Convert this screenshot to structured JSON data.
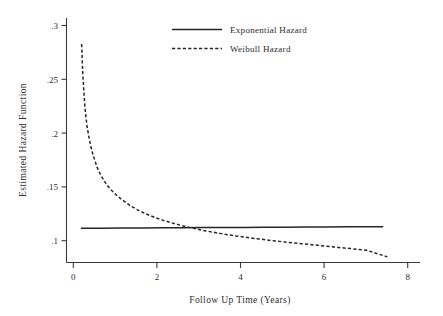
{
  "chart_data": {
    "type": "line",
    "title": "",
    "xlabel": "Follow Up Time (Years)",
    "ylabel": "Estimated Hazard Function",
    "xlim": [
      -0.35,
      8.3
    ],
    "ylim": [
      0.082,
      0.307
    ],
    "xticks": [
      0,
      2,
      4,
      6,
      8
    ],
    "xtick_labels": [
      "0",
      "2",
      "4",
      "6",
      "8"
    ],
    "yticks": [
      0.1,
      0.15,
      0.2,
      0.25,
      0.3
    ],
    "ytick_labels": [
      ".1",
      ".15",
      ".2",
      ".25",
      ".3"
    ],
    "grid": false,
    "legend_position": "top-center",
    "series": [
      {
        "name": "Exponential Hazard",
        "style": "solid",
        "x": [
          0,
          0.5,
          1,
          1.5,
          2,
          2.5,
          3,
          3.5,
          4,
          4.5,
          5,
          5.5,
          6,
          6.5,
          7,
          7.4
        ],
        "values": [
          0.1135,
          0.1136,
          0.1137,
          0.1138,
          0.1139,
          0.114,
          0.1141,
          0.1142,
          0.1143,
          0.1144,
          0.1145,
          0.1146,
          0.1147,
          0.1148,
          0.1149,
          0.115
        ]
      },
      {
        "name": "Weibull Hazard",
        "style": "dashed",
        "x": [
          0.02,
          0.05,
          0.1,
          0.15,
          0.2,
          0.25,
          0.3,
          0.4,
          0.5,
          0.6,
          0.7,
          0.8,
          0.9,
          1.0,
          1.2,
          1.4,
          1.6,
          1.8,
          2.0,
          2.3,
          2.6,
          3.0,
          3.4,
          3.8,
          4.2,
          4.6,
          5.0,
          5.4,
          5.8,
          6.2,
          6.6,
          7.0,
          7.5
        ],
        "values": [
          0.283,
          0.254,
          0.225,
          0.208,
          0.197,
          0.188,
          0.181,
          0.1695,
          0.1615,
          0.1555,
          0.1505,
          0.1465,
          0.143,
          0.14,
          0.1345,
          0.1302,
          0.1266,
          0.1236,
          0.121,
          0.1176,
          0.1148,
          0.1115,
          0.1088,
          0.1064,
          0.1044,
          0.1025,
          0.1008,
          0.0993,
          0.0978,
          0.0962,
          0.0948,
          0.0932,
          0.0872
        ]
      }
    ]
  },
  "legend": {
    "items": [
      {
        "label": "Exponential Hazard",
        "style": "solid"
      },
      {
        "label": "Weibull Hazard",
        "style": "dashed"
      }
    ]
  },
  "axes": {
    "x_title": "Follow Up Time (Years)",
    "y_title": "Estimated Hazard Function"
  }
}
